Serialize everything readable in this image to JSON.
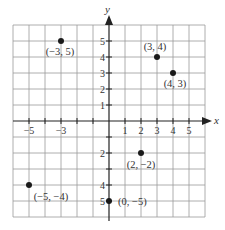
{
  "chart_data": {
    "type": "scatter",
    "title": "",
    "xlabel": "x",
    "ylabel": "y",
    "xlim": [
      -6,
      6
    ],
    "ylim": [
      -6,
      6
    ],
    "grid": true,
    "x_tick_labels": [
      "-5",
      "-3",
      "1",
      "2",
      "3",
      "4",
      "5"
    ],
    "x_tick_values": [
      -5,
      -3,
      1,
      2,
      3,
      4,
      5
    ],
    "y_tick_labels": [
      "5",
      "4",
      "3",
      "2",
      "1",
      "2",
      "4",
      "5"
    ],
    "y_tick_values": [
      5,
      4,
      3,
      2,
      1,
      -2,
      -4,
      -5
    ],
    "points": [
      {
        "x": -3,
        "y": 5,
        "label": "(−3, 5)"
      },
      {
        "x": 3,
        "y": 4,
        "label": "(3, 4)"
      },
      {
        "x": 4,
        "y": 3,
        "label": "(4, 3)"
      },
      {
        "x": 2,
        "y": -2,
        "label": "(2, −2)"
      },
      {
        "x": -5,
        "y": -4,
        "label": "(−5, −4)"
      },
      {
        "x": 0,
        "y": -5,
        "label": "(0, −5)"
      }
    ]
  },
  "axes": {
    "x_label": "x",
    "y_label": "y"
  }
}
